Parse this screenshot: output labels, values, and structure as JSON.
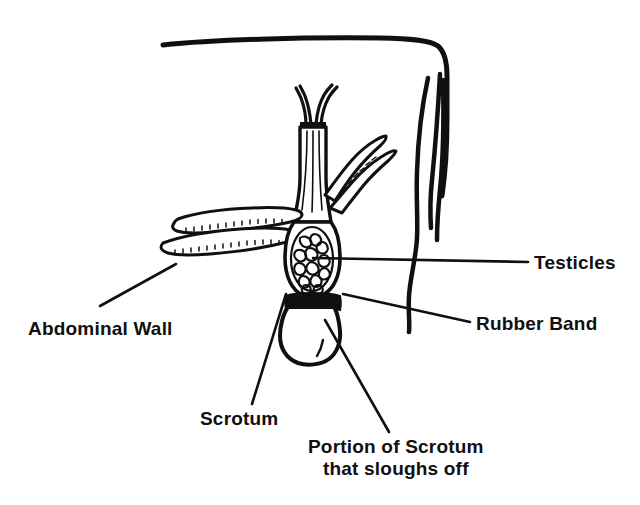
{
  "figure": {
    "ink_color": "#101010",
    "background_color": "#ffffff"
  },
  "labels": {
    "testicles": "Testicles",
    "rubber_band": "Rubber Band",
    "abdominal_wall": "Abdominal Wall",
    "scrotum": "Scrotum",
    "portion_line1": "Portion of Scrotum",
    "portion_line2": "that sloughs off"
  },
  "parts": [
    {
      "name": "abdominal-wall",
      "label": "Abdominal Wall"
    },
    {
      "name": "testicles",
      "label": "Testicles"
    },
    {
      "name": "rubber-band",
      "label": "Rubber Band"
    },
    {
      "name": "scrotum",
      "label": "Scrotum"
    },
    {
      "name": "sloughing-portion",
      "label": "Portion of Scrotum that sloughs off"
    }
  ]
}
